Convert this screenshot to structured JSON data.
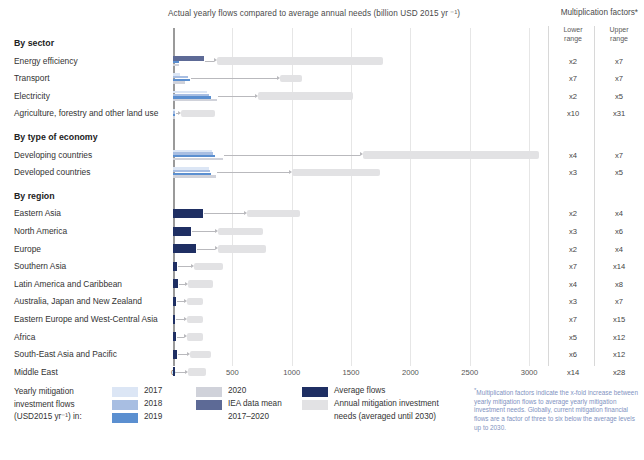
{
  "header": {
    "axis_title": "Actual yearly flows compared to average annual needs (billion USD 2015 yr ⁻¹)",
    "mf_title": "Multiplication factors*",
    "mf_lower_head": "Lower\nrange",
    "mf_lower_head_l1": "Lower",
    "mf_lower_head_l2": "range",
    "mf_upper_head_l1": "Upper",
    "mf_upper_head_l2": "range"
  },
  "legend": {
    "title_l1": "Yearly mitigation",
    "title_l2": "investment flows",
    "title_l3": "(USD2015 yr⁻¹) in:",
    "y2017": "2017",
    "y2018": "2018",
    "y2019": "2019",
    "y2020": "2020",
    "iea_l1": "IEA data mean",
    "iea_l2": "2017–2020",
    "avg_flows": "Average flows",
    "needs_l1": "Annual mitigation investment",
    "needs_l2": "needs (averaged until 2030)",
    "footnote": "Multiplication factors indicate the x-fold increase between yearly mitigation flows to average yearly mitigation investment needs. Globally, current mitigation financial flows are a factor of three to six below the average levels up to 2030."
  },
  "colors": {
    "y2017": "#dce6f5",
    "y2018": "#a8bee2",
    "y2019": "#5b8fd0",
    "y2020": "#d0d2da",
    "iea_mean": "#5d6a96",
    "average_flows": "#1f2f63",
    "needs": "#e2e2e4",
    "axis": "#9a9a9a",
    "grid": "#e6e6e6",
    "footnote_text": "#7f93bf"
  },
  "chart_data": {
    "type": "bar",
    "xlabel": "billion USD 2015 yr⁻¹",
    "ylabel": "",
    "xlim": [
      0,
      3100
    ],
    "xticks": [
      0,
      500,
      1000,
      1500,
      2000,
      2500,
      3000
    ],
    "xtick_labels": [
      "0",
      "500",
      "1000",
      "1500",
      "2000",
      "2500",
      "3000"
    ],
    "grid": true,
    "legend_position": "bottom",
    "series_names": [
      "2017",
      "2018",
      "2019",
      "2020",
      "IEA data mean 2017-2020",
      "Average flows",
      "Annual mitigation investment needs (averaged until 2030)"
    ],
    "groups": [
      {
        "name": "By sector",
        "rows": [
          {
            "label": "Energy efficiency",
            "flows": {
              "y2017": 40,
              "y2018": 45,
              "y2019": 48,
              "y2020": 50,
              "iea_mean": 260
            },
            "average_flows": null,
            "needs_start": 370,
            "needs_end": 1770,
            "lower": "x2",
            "upper": "x7"
          },
          {
            "label": "Transport",
            "flows": {
              "y2017": 60,
              "y2018": 130,
              "y2019": 140,
              "y2020": 100,
              "iea_mean": null
            },
            "average_flows": null,
            "needs_start": 900,
            "needs_end": 1090,
            "lower": "x7",
            "upper": "x7"
          },
          {
            "label": "Electricity",
            "flows": {
              "y2017": 290,
              "y2018": 300,
              "y2019": 320,
              "y2020": 370,
              "iea_mean": null
            },
            "average_flows": null,
            "needs_start": 720,
            "needs_end": 1520,
            "lower": "x2",
            "upper": "x5"
          },
          {
            "label": "Agriculture, forestry and other land use",
            "flows": {
              "y2017": 10,
              "y2018": 12,
              "y2019": 14,
              "y2020": 16,
              "iea_mean": null
            },
            "average_flows": null,
            "needs_start": 70,
            "needs_end": 350,
            "lower": "x10",
            "upper": "x31"
          }
        ]
      },
      {
        "name": "By type of economy",
        "rows": [
          {
            "label": "Developing countries",
            "flows": {
              "y2017": 330,
              "y2018": 340,
              "y2019": 350,
              "y2020": 420,
              "iea_mean": null
            },
            "average_flows": null,
            "needs_start": 1600,
            "needs_end": 3080,
            "lower": "x4",
            "upper": "x7"
          },
          {
            "label": "Developed countries",
            "flows": {
              "y2017": 300,
              "y2018": 310,
              "y2019": 320,
              "y2020": 360,
              "iea_mean": null
            },
            "average_flows": null,
            "needs_start": 1000,
            "needs_end": 1740,
            "lower": "x3",
            "upper": "x5"
          }
        ]
      },
      {
        "name": "By region",
        "rows": [
          {
            "label": "Eastern Asia",
            "average_flows": 250,
            "needs_start": 620,
            "needs_end": 1070,
            "lower": "x2",
            "upper": "x4"
          },
          {
            "label": "North America",
            "average_flows": 155,
            "needs_start": 375,
            "needs_end": 760,
            "lower": "x3",
            "upper": "x6"
          },
          {
            "label": "Europe",
            "average_flows": 195,
            "needs_start": 375,
            "needs_end": 780,
            "lower": "x2",
            "upper": "x4"
          },
          {
            "label": "Southern Asia",
            "average_flows": 32,
            "needs_start": 180,
            "needs_end": 420,
            "lower": "x7",
            "upper": "x14"
          },
          {
            "label": "Latin America and Caribbean",
            "average_flows": 38,
            "needs_start": 130,
            "needs_end": 340,
            "lower": "x4",
            "upper": "x8"
          },
          {
            "label": "Australia, Japan and New Zealand",
            "average_flows": 28,
            "needs_start": 115,
            "needs_end": 250,
            "lower": "x3",
            "upper": "x7"
          },
          {
            "label": "Eastern Europe and West-Central Asia",
            "average_flows": 18,
            "needs_start": 120,
            "needs_end": 250,
            "lower": "x7",
            "upper": "x15"
          },
          {
            "label": "Africa",
            "average_flows": 22,
            "needs_start": 120,
            "needs_end": 250,
            "lower": "x5",
            "upper": "x12"
          },
          {
            "label": "South-East Asia and Pacific",
            "average_flows": 30,
            "needs_start": 140,
            "needs_end": 320,
            "lower": "x6",
            "upper": "x12"
          },
          {
            "label": "Middle East",
            "average_flows": 12,
            "needs_start": 130,
            "needs_end": 280,
            "lower": "x14",
            "upper": "x28"
          }
        ]
      }
    ]
  }
}
